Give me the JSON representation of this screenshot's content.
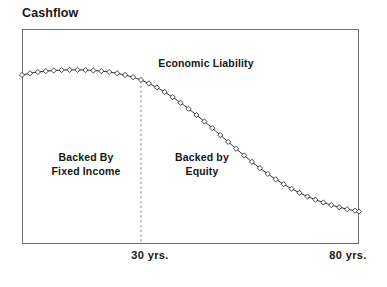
{
  "chart_data": {
    "type": "line",
    "title": "Cashflow",
    "xlabel": "",
    "ylabel": "Cashflow",
    "grid": false,
    "legend": null,
    "axis": {
      "x_tick_labels": [
        "30 yrs.",
        "80 yrs."
      ],
      "x_tick_positions": [
        30,
        80
      ],
      "xlim": [
        0,
        85
      ],
      "ylim": [
        0,
        100
      ],
      "y_tick_labels": []
    },
    "marker": "diamond",
    "marker_fill": "#ffffff",
    "marker_edge": "#1a1a1a",
    "line_color": "#1a1a1a",
    "series": [
      {
        "name": "Cashflow",
        "x": [
          0,
          2,
          4,
          6,
          8,
          10,
          12,
          14,
          16,
          18,
          20,
          22,
          24,
          26,
          28,
          30,
          32,
          34,
          36,
          38,
          40,
          42,
          44,
          46,
          48,
          50,
          52,
          54,
          56,
          58,
          60,
          62,
          64,
          66,
          68,
          70,
          72,
          74,
          76,
          78,
          80,
          82,
          84,
          85
        ],
        "values": [
          78.6,
          79.4,
          80.0,
          80.4,
          80.7,
          80.9,
          81.0,
          81.0,
          80.9,
          80.7,
          80.4,
          80.0,
          79.4,
          78.6,
          77.6,
          76.3,
          74.7,
          72.8,
          70.7,
          68.3,
          65.7,
          62.9,
          60.0,
          57.0,
          53.9,
          50.7,
          47.5,
          44.3,
          41.2,
          38.2,
          35.3,
          32.6,
          30.1,
          27.8,
          25.7,
          23.8,
          22.1,
          20.6,
          19.3,
          18.1,
          17.1,
          16.2,
          15.5,
          15.1
        ]
      }
    ],
    "annotations": [
      {
        "name": "economic-liability",
        "text": "Economic Liability",
        "x": 38,
        "y": 88
      },
      {
        "name": "backed-by-fixed-income",
        "text": "Backed By\nFixed Income",
        "x": 16,
        "y": 42
      },
      {
        "name": "backed-by-equity",
        "text": "Backed by\nEquity",
        "x": 45,
        "y": 42
      }
    ],
    "divider": {
      "name": "thirty-year-divider",
      "x": 30,
      "style": "dashed",
      "color": "#6f6f6f"
    }
  },
  "chart": {
    "title": "Cashflow",
    "annotations": {
      "economic_liability": "Economic Liability",
      "backed_by_fixed_income_line1": "Backed By",
      "backed_by_fixed_income_line2": "Fixed Income",
      "backed_by_equity_line1": "Backed by",
      "backed_by_equity_line2": "Equity"
    },
    "x_axis": {
      "tick_30": "30 yrs.",
      "tick_80": "80 yrs."
    },
    "colors": {
      "line": "#1a1a1a",
      "marker_fill": "#ffffff",
      "marker_edge": "#1a1a1a",
      "frame": "#6f6f6f",
      "divider": "#6f6f6f",
      "text": "#161616",
      "background": "#ffffff"
    }
  }
}
